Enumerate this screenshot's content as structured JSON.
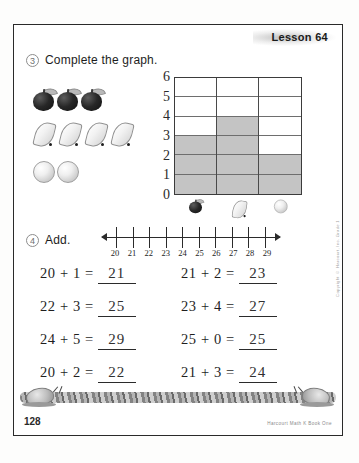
{
  "page": {
    "lesson_label": "Lesson 64",
    "page_number": "128",
    "publisher": "Harcourt Math K Book One",
    "side_copyright": "Copyright © Harcourt, Inc. Grade 1"
  },
  "exercise3": {
    "number": "3",
    "instruction": "Complete the graph.",
    "key_rows": [
      {
        "fruit": "apple",
        "count": 3
      },
      {
        "fruit": "banana",
        "count": 4
      },
      {
        "fruit": "orange",
        "count": 2
      }
    ]
  },
  "chart_data": {
    "type": "bar",
    "title": "Complete the graph.",
    "categories": [
      "apple",
      "banana",
      "orange"
    ],
    "values": [
      3,
      4,
      2
    ],
    "xlabel": "",
    "ylabel": "",
    "ylim": [
      0,
      6
    ],
    "y_ticks": [
      "6",
      "5",
      "4",
      "3",
      "2",
      "1",
      "0"
    ],
    "grid": true,
    "legend": "none",
    "bar_color": "#c4c4c4",
    "grid_color": "#6e6e6e"
  },
  "exercise4": {
    "number": "4",
    "instruction": "Add.",
    "numberline": {
      "labels": [
        "20",
        "21",
        "22",
        "23",
        "24",
        "25",
        "26",
        "27",
        "28",
        "29"
      ]
    },
    "problems": [
      {
        "expr": "20 + 1 =",
        "answer": "21"
      },
      {
        "expr": "21 + 2 =",
        "answer": "23"
      },
      {
        "expr": "22 + 3 =",
        "answer": "25"
      },
      {
        "expr": "23 + 4 =",
        "answer": "27"
      },
      {
        "expr": "24 + 5 =",
        "answer": "29"
      },
      {
        "expr": "25 + 0 =",
        "answer": "25"
      },
      {
        "expr": "20 + 2 =",
        "answer": "22"
      },
      {
        "expr": "21 + 3 =",
        "answer": "24"
      }
    ]
  }
}
